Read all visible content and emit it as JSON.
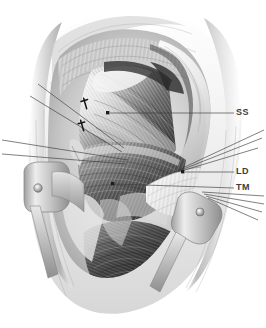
{
  "illustration": {
    "title": "Surgical exposure of the shoulder — anterior deltopectoral approach",
    "subject": "shoulder-dissection",
    "style": "grayscale-airbrush-medical-illustration",
    "background_color": "#ffffff",
    "ink_color": "#3c3c3c",
    "canvas": {
      "width": 266,
      "height": 328
    }
  },
  "labels": [
    {
      "id": "ss",
      "text": "SS",
      "meaning": "subscapularis",
      "x": 236,
      "y": 108,
      "leader": {
        "from_x": 234,
        "from_y": 113,
        "to_x": 110,
        "to_y": 113
      },
      "dot": {
        "x": 108,
        "y": 113
      }
    },
    {
      "id": "ld",
      "text": "LD",
      "meaning": "latissimus dorsi",
      "x": 236,
      "y": 168,
      "leader": {
        "from_x": 234,
        "from_y": 172,
        "to_x": 185,
        "to_y": 172
      },
      "dot": {
        "x": 183,
        "y": 172
      }
    },
    {
      "id": "tm",
      "text": "TM",
      "meaning": "teres major",
      "x": 236,
      "y": 184,
      "leader": {
        "from_x": 234,
        "from_y": 188,
        "to_x": 115,
        "to_y": 184
      },
      "dot": {
        "x": 113,
        "y": 184
      }
    }
  ],
  "markers": [
    {
      "id": "dagger-upper",
      "glyph": "†",
      "x": 85,
      "y": 103
    },
    {
      "id": "dagger-lower",
      "glyph": "†",
      "x": 82,
      "y": 125
    }
  ],
  "unlabeled_leaders": {
    "left_group_count": 4,
    "right_group_count": 5,
    "description": "fine pointer lines running to tissue planes with no printed text"
  },
  "retractors": [
    {
      "id": "retractor-left",
      "x": 28,
      "y": 176,
      "rivet": true
    },
    {
      "id": "retractor-right",
      "x": 196,
      "y": 203,
      "rivet": true
    }
  ],
  "palette": {
    "paper": "#ffffff",
    "line": "#3c3c3c",
    "muscle_dark": "#3a3a3a",
    "muscle_mid": "#8a8a8a",
    "muscle_light": "#d8d8d8",
    "skin_shadow": "#b9b9b9",
    "metal_light": "#e6e6e6",
    "metal_mid": "#b4b4b4",
    "metal_dark": "#868686"
  }
}
